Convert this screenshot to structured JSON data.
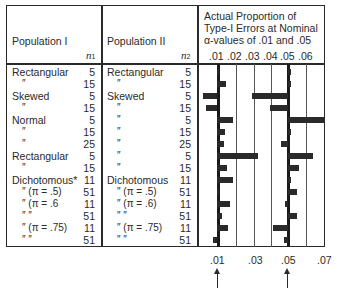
{
  "header": {
    "pop1_label": "Population I",
    "pop1_n": "n",
    "pop1_n_sub": "1",
    "pop2_label": "Population II",
    "pop2_n": "n",
    "pop2_n_sub": "2",
    "chart_title_line1": "Actual Proportion of",
    "chart_title_line2": "Type-I Errors at Nominal",
    "chart_title_line3": "α-values of .01 and .05",
    "top_ticks": [
      ".01",
      ".02",
      ".03",
      ".04",
      ".05",
      ".06"
    ],
    "bottom_ticks": [
      ".01",
      ".03",
      ".05",
      ".07"
    ]
  },
  "rows": [
    {
      "pop1": "Rectangular",
      "n1": "5",
      "pop2": "Rectangular",
      "n2": "5"
    },
    {
      "pop1": "″",
      "n1": "15",
      "pop2": "″",
      "n2": "15"
    },
    {
      "pop1": "Skewed",
      "n1": "5",
      "pop2": "Skewed",
      "n2": "5"
    },
    {
      "pop1": "″",
      "n1": "15",
      "pop2": "″",
      "n2": "15"
    },
    {
      "pop1": "Normal",
      "n1": "5",
      "pop2": "″",
      "n2": "5"
    },
    {
      "pop1": "″",
      "n1": "15",
      "pop2": "″",
      "n2": "15"
    },
    {
      "pop1": "″",
      "n1": "25",
      "pop2": "″",
      "n2": "25"
    },
    {
      "pop1": "Rectangular",
      "n1": "5",
      "pop2": "″",
      "n2": "5"
    },
    {
      "pop1": "″",
      "n1": "15",
      "pop2": "″",
      "n2": "15"
    },
    {
      "pop1": "Dichotomous*",
      "n1": "11",
      "pop2": "Dichotomous",
      "n2": "11"
    },
    {
      "pop1": "″   (π = .5)",
      "n1": "51",
      "pop2": "″   (π = .5)",
      "n2": "51"
    },
    {
      "pop1": "″   (π = .6",
      "n1": "11",
      "pop2": "″   (π = .6)",
      "n2": "11"
    },
    {
      "pop1": "″          ″",
      "n1": "51",
      "pop2": "″          ″",
      "n2": "51"
    },
    {
      "pop1": "″   (π = .75)",
      "n1": "11",
      "pop2": "″   (π = .75)",
      "n2": "11"
    },
    {
      "pop1": "″          ″",
      "n1": "51",
      "pop2": "″          ″",
      "n2": "51"
    }
  ],
  "chart_data": {
    "type": "bar",
    "orientation": "horizontal",
    "categories": [
      "Rectangular 5 / Rectangular 5",
      "Rectangular 15 / Rectangular 15",
      "Skewed 5 / Skewed 5",
      "Skewed 15 / Skewed 15",
      "Normal 5 / Skewed 5",
      "Normal 15 / Skewed 15",
      "Normal 25 / Skewed 25",
      "Rectangular 5 / Skewed 5",
      "Rectangular 15 / Skewed 15",
      "Dichotomous 11 / Dichotomous 11",
      "Dichotomous (π=.5) 51 / (π=.5) 51",
      "Dichotomous (π=.6) 11 / (π=.6) 11",
      "Dichotomous (π=.6) 51 / (π=.6) 51",
      "Dichotomous (π=.75) 11 / (π=.75) 11",
      "Dichotomous (π=.75) 51 / (π=.75) 51"
    ],
    "series": [
      {
        "name": "Nominal α = .01",
        "baseline": 0.01,
        "values": [
          0.0105,
          0.015,
          0.002,
          0.004,
          0.019,
          0.0145,
          0.014,
          0.033,
          0.016,
          0.019,
          0.0105,
          0.0175,
          0.013,
          0.0165,
          0.008
        ]
      },
      {
        "name": "Nominal α = .05",
        "baseline": 0.05,
        "values": [
          0.0505,
          0.0505,
          0.03,
          0.04,
          0.07,
          0.0505,
          0.046,
          0.064,
          0.056,
          0.0515,
          0.055,
          0.0485,
          0.055,
          0.0415,
          0.048
        ]
      }
    ],
    "xlabel": "",
    "ylabel": "",
    "xlim": [
      0.0,
      0.07
    ],
    "top_tick_labels": [
      ".01",
      ".02",
      ".03",
      ".04",
      ".05",
      ".06"
    ],
    "bottom_tick_labels": [
      ".01",
      ".03",
      ".05",
      ".07"
    ],
    "annotations": [
      "arrow at .01",
      "arrow at .05"
    ],
    "grid": true,
    "legend": "none"
  }
}
